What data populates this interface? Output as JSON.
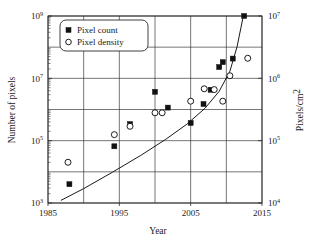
{
  "chart_data": {
    "type": "scatter",
    "title": "",
    "xlabel": "Year",
    "ylabel": "Number of pixels",
    "y2label": "Pixels/cm2",
    "y2label_display": "Pixels/cm",
    "y2label_sup": "2",
    "xlim": [
      1985,
      2015
    ],
    "ylim": [
      1000,
      1000000000
    ],
    "y2lim": [
      10000,
      10000000
    ],
    "yscale": "log",
    "y2scale": "log",
    "grid": true,
    "legend_position": "top-left",
    "xticks": [
      "1985",
      "1995",
      "2005",
      "2015"
    ],
    "xtick_values": [
      1985,
      1995,
      2005,
      2015
    ],
    "xgrid_values": [
      1985,
      1990,
      1995,
      2000,
      2005,
      2010,
      2015
    ],
    "yticks": [
      {
        "mantissa": "10",
        "exponent": "9",
        "value": 1000000000
      },
      {
        "mantissa": "10",
        "exponent": "7",
        "value": 10000000
      },
      {
        "mantissa": "10",
        "exponent": "5",
        "value": 100000
      },
      {
        "mantissa": "10",
        "exponent": "3",
        "value": 1000
      }
    ],
    "ygrid_values": [
      1000,
      10000,
      100000,
      1000000,
      10000000,
      100000000,
      1000000000
    ],
    "y2ticks": [
      {
        "mantissa": "10",
        "exponent": "7",
        "value": 10000000
      },
      {
        "mantissa": "10",
        "exponent": "6",
        "value": 1000000
      },
      {
        "mantissa": "10",
        "exponent": "5",
        "value": 100000
      },
      {
        "mantissa": "10",
        "exponent": "4",
        "value": 10000
      }
    ],
    "series": [
      {
        "name": "Pixel count",
        "marker": "filled-square",
        "axis": "left",
        "points": [
          {
            "x": 1988.0,
            "y": 4000
          },
          {
            "x": 1994.3,
            "y": 66000
          },
          {
            "x": 1996.5,
            "y": 340000
          },
          {
            "x": 2001.8,
            "y": 1150000
          },
          {
            "x": 2000.0,
            "y": 3700000
          },
          {
            "x": 2005.0,
            "y": 370000
          },
          {
            "x": 2006.8,
            "y": 1500000
          },
          {
            "x": 2007.8,
            "y": 4300000
          },
          {
            "x": 2009.0,
            "y": 23000000
          },
          {
            "x": 2009.5,
            "y": 33000000
          },
          {
            "x": 2010.9,
            "y": 43000000
          },
          {
            "x": 2012.5,
            "y": 1000000000
          }
        ]
      },
      {
        "name": "Pixel density",
        "marker": "open-circle",
        "axis": "right",
        "points": [
          {
            "x": 1987.8,
            "y": 45000
          },
          {
            "x": 1994.3,
            "y": 125000
          },
          {
            "x": 1996.5,
            "y": 170000
          },
          {
            "x": 2000.0,
            "y": 280000
          },
          {
            "x": 2001.0,
            "y": 280000
          },
          {
            "x": 2005.0,
            "y": 430000
          },
          {
            "x": 2006.9,
            "y": 680000
          },
          {
            "x": 2008.3,
            "y": 660000
          },
          {
            "x": 2009.5,
            "y": 430000
          },
          {
            "x": 2010.5,
            "y": 1100000
          },
          {
            "x": 2013.0,
            "y": 2100000
          }
        ]
      }
    ],
    "trend": {
      "name": "pixel-density-trend",
      "points": [
        {
          "x": 1986.8,
          "y": 11000
        },
        {
          "x": 1990.0,
          "y": 17000
        },
        {
          "x": 1994.0,
          "y": 31000
        },
        {
          "x": 1998.0,
          "y": 58000
        },
        {
          "x": 2001.5,
          "y": 105000
        },
        {
          "x": 2004.5,
          "y": 185000
        },
        {
          "x": 2007.0,
          "y": 330000
        },
        {
          "x": 2009.0,
          "y": 620000
        },
        {
          "x": 2010.5,
          "y": 1300000
        },
        {
          "x": 2011.5,
          "y": 3200000
        },
        {
          "x": 2012.3,
          "y": 9000000
        }
      ]
    },
    "legend": [
      {
        "label": "Pixel count",
        "marker": "filled-square"
      },
      {
        "label": "Pixel density",
        "marker": "open-circle"
      }
    ]
  }
}
